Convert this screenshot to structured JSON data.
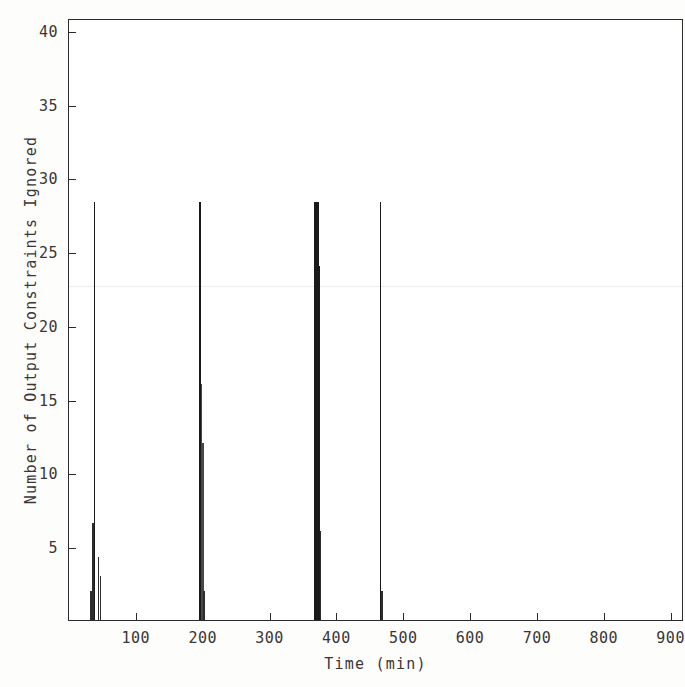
{
  "chart_data": {
    "type": "bar",
    "title": "",
    "xlabel": "Time (min)",
    "ylabel": "Number of Output Constraints Ignored",
    "xlim": [
      0,
      920
    ],
    "ylim": [
      0,
      40.8
    ],
    "grid": false,
    "legend": null,
    "xticks": [
      100,
      200,
      300,
      400,
      500,
      600,
      700,
      800,
      900
    ],
    "yticks": [
      5,
      10,
      15,
      20,
      25,
      30,
      35,
      40
    ],
    "x": [
      33,
      36,
      38,
      44,
      47,
      195,
      196,
      198,
      200,
      202,
      368,
      370,
      372,
      374,
      376,
      466,
      468
    ],
    "values": [
      2.0,
      6.6,
      28.3,
      4.3,
      3.0,
      1.5,
      28.3,
      16.0,
      12.0,
      2.0,
      28.3,
      28.3,
      28.3,
      24.0,
      6.0,
      28.3,
      2.0
    ],
    "series": [
      {
        "name": "Output constraints ignored",
        "points": [
          {
            "t": 33,
            "v": 2.0
          },
          {
            "t": 36,
            "v": 6.6
          },
          {
            "t": 38,
            "v": 28.3
          },
          {
            "t": 44,
            "v": 4.3
          },
          {
            "t": 47,
            "v": 3.0
          },
          {
            "t": 195,
            "v": 1.5
          },
          {
            "t": 196,
            "v": 28.3
          },
          {
            "t": 198,
            "v": 16.0
          },
          {
            "t": 200,
            "v": 12.0
          },
          {
            "t": 202,
            "v": 2.0
          },
          {
            "t": 368,
            "v": 28.3
          },
          {
            "t": 370,
            "v": 28.3
          },
          {
            "t": 372,
            "v": 28.3
          },
          {
            "t": 374,
            "v": 24.0
          },
          {
            "t": 376,
            "v": 6.0
          },
          {
            "t": 466,
            "v": 28.3
          },
          {
            "t": 468,
            "v": 2.0
          }
        ]
      }
    ],
    "clusters": [
      {
        "center": 38,
        "peak": 28.3
      },
      {
        "center": 197,
        "peak": 28.3
      },
      {
        "center": 371,
        "peak": 28.3
      },
      {
        "center": 467,
        "peak": 28.3
      }
    ]
  },
  "axes": {
    "y_title": "Number of Output Constraints Ignored",
    "x_title": "Time (min)",
    "y_tick_labels": [
      "5",
      "10",
      "15",
      "20",
      "25",
      "30",
      "35",
      "40"
    ],
    "x_tick_labels": [
      "100",
      "200",
      "300",
      "400",
      "500",
      "600",
      "700",
      "800",
      "900"
    ]
  },
  "colors": {
    "ink": "#1a1a1a",
    "axis": "#2b2b2b",
    "text": "#3a3636",
    "background": "#ffffff"
  }
}
